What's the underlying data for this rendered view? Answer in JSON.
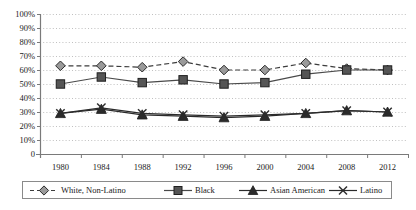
{
  "chart_data": {
    "type": "line",
    "title": "",
    "subtitle": "",
    "xlabel": "",
    "ylabel": "",
    "categories": [
      "1980",
      "1984",
      "1988",
      "1992",
      "1996",
      "2000",
      "2004",
      "2008",
      "2012"
    ],
    "ylim": [
      0,
      100
    ],
    "ytick_labels": [
      "0",
      "10%",
      "20%",
      "30%",
      "40%",
      "50%",
      "60%",
      "70%",
      "80%",
      "90%",
      "100%"
    ],
    "ytick_values": [
      0,
      10,
      20,
      30,
      40,
      50,
      60,
      70,
      80,
      90,
      100
    ],
    "grid": "horizontal-dotted",
    "legend_position": "bottom",
    "series": [
      {
        "name": "White, Non-Latino",
        "marker": "diamond",
        "line_style": "dashed",
        "color": "#3d3d3d",
        "values": [
          63,
          63,
          62,
          66,
          60,
          60,
          65,
          61,
          60
        ]
      },
      {
        "name": "Black",
        "marker": "square",
        "line_style": "solid",
        "color": "#4a4a4a",
        "values": [
          50,
          55,
          51,
          53,
          50,
          51,
          57,
          60,
          60
        ]
      },
      {
        "name": "Asian American",
        "marker": "triangle",
        "line_style": "solid",
        "color": "#2b2b2b",
        "values": [
          29,
          32,
          28,
          27,
          26,
          27,
          29,
          31,
          30
        ]
      },
      {
        "name": "Latino",
        "marker": "x",
        "line_style": "solid",
        "color": "#2b2b2b",
        "values": [
          29,
          33,
          29,
          28,
          27,
          28,
          29,
          31,
          30
        ]
      }
    ]
  },
  "legend": {
    "entries": [
      {
        "label": "White, Non-Latino"
      },
      {
        "label": "Black"
      },
      {
        "label": "Asian American"
      },
      {
        "label": "Latino"
      }
    ]
  },
  "colors": {
    "axis": "#7a7a7a",
    "grid": "#b0b0b0",
    "text": "#1a1a1a",
    "plot_background": "#ffffff"
  }
}
